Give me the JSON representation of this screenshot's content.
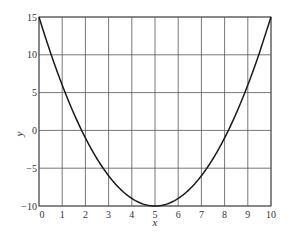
{
  "chart_data": {
    "type": "line",
    "title": "",
    "xlabel": "x",
    "ylabel": "y",
    "xlim": [
      0,
      10
    ],
    "ylim": [
      -10,
      15
    ],
    "x_ticks": [
      0,
      1,
      2,
      3,
      4,
      5,
      6,
      7,
      8,
      9,
      10
    ],
    "y_ticks": [
      -10,
      -5,
      0,
      5,
      10,
      15
    ],
    "x_tick_labels": [
      "0",
      "1",
      "2",
      "3",
      "4",
      "5",
      "6",
      "7",
      "8",
      "9",
      "10"
    ],
    "y_tick_labels": [
      "−10",
      "−5",
      "0",
      "5",
      "10",
      "15"
    ],
    "grid": true,
    "legend": null,
    "series": [
      {
        "name": "y = (x - 5)^2 - 10",
        "x": [
          0,
          0.5,
          1,
          1.5,
          2,
          2.5,
          3,
          3.5,
          4,
          4.5,
          5,
          5.5,
          6,
          6.5,
          7,
          7.5,
          8,
          8.5,
          9,
          9.5,
          10
        ],
        "y": [
          15,
          10.25,
          6,
          2.25,
          -1,
          -3.75,
          -6,
          -7.75,
          -9,
          -9.75,
          -10,
          -9.75,
          -9,
          -7.75,
          -6,
          -3.75,
          -1,
          2.25,
          6,
          10.25,
          15
        ]
      }
    ],
    "colors": {
      "line": "#1a1a1a",
      "grid": "#555555",
      "text": "#333333"
    }
  }
}
